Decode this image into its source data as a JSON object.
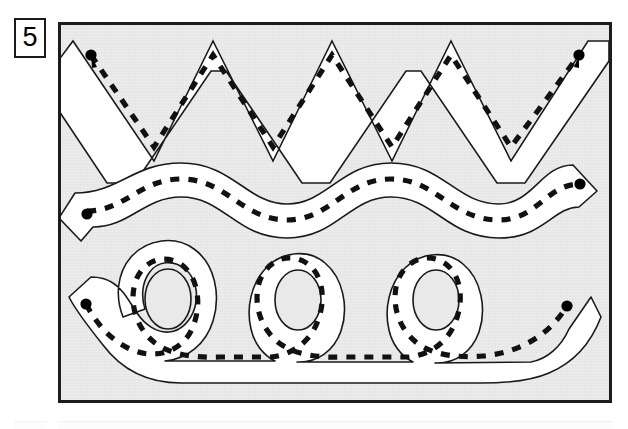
{
  "worksheet": {
    "exercise_number": "5",
    "frame": {
      "panel_color": "#e9e9e9",
      "border_color": "#1c1c1c",
      "x": 58,
      "y": 22,
      "width": 554,
      "height": 381
    },
    "stroke_colors": {
      "outline": "#1a1a1a",
      "lane_fill": "#ffffff",
      "dash_guide": "#111111",
      "start_dot": "#000000"
    },
    "tracing_paths": [
      {
        "id": "zigzag-path",
        "name": "zigzag-tracing-path",
        "shape": "zigzag",
        "peaks": 4,
        "lane_width": 30,
        "dash_pattern": "9 9",
        "start_dot": {
          "x": 37,
          "y": 29
        },
        "end_dot": {
          "x": 515,
          "y": 29
        },
        "centerline": "M 37,29 L 93,113 L 152,29 L 212,113 L 271,29 L 331,113 L 390,29 L 450,113 L 515,29",
        "outline": "M 12,16 L 93,136 L 152,16 L 212,136 L 271,16 L 331,136 L 390,16 L 450,136 L 540,16 L 540,44 L 464,156 L 436,156 L 360,44 L 345,44 L 269,156 L 241,156 L 165,44 L 150,44 L 74,156 L 46,156 L 12,106 Z"
      },
      {
        "id": "wave-path",
        "name": "wave-tracing-path",
        "shape": "wave",
        "periods": 2.5,
        "lane_width": 28,
        "dash_pattern": "9 9",
        "start_dot": {
          "x": 34,
          "y": 196
        },
        "end_dot": {
          "x": 511,
          "y": 167
        },
        "centerline": "M 34,196 C 70,196 86,166 122,166 C 164,166 178,205 224,205 C 268,205 282,166 324,166 C 368,166 382,205 428,205 C 470,205 478,167 511,167",
        "outline": "M 19,181 C 62,181 75,151 122,151 C 172,151 185,190 224,190 C 262,190 275,151 324,151 C 374,151 386,190 428,190 C 462,190 470,152 502,152 L 526,176 L 511,190 C 489,190 478,220 428,220 C 378,220 366,181 324,181 C 283,181 271,220 224,220 C 176,220 164,181 122,181 C 86,181 72,211 34,211 L 22,224 L 5,207 Z"
      },
      {
        "id": "loops-path",
        "name": "loops-tracing-path",
        "shape": "loops",
        "loops": 3,
        "lane_width": 26,
        "dash_pattern": "9 9",
        "start_dot": {
          "x": 33,
          "y": 301
        },
        "end_dot": {
          "x": 512,
          "y": 301
        },
        "centerline": "M 33,301 C 45,336 86,354 130,336 C 166,322 166,266 135,256 C 106,247 86,274 90,300 C 95,333 130,344 180,340 L 262,338 C 296,330 310,278 280,258 C 252,240 228,272 234,300 C 240,333 274,345 322,341 L 404,338 C 440,330 452,276 422,257 C 394,240 370,272 376,300 C 382,334 420,345 462,337 C 492,330 506,318 512,301",
        "outline": "three-loop compound outline"
      }
    ]
  }
}
